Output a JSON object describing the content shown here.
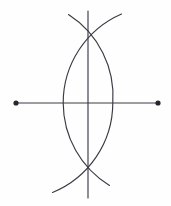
{
  "figure": {
    "title": "Perpendicular bisector construction",
    "kind": "geometric-construction",
    "background_color": "#fefefe",
    "stroke_color": "#3a3a44",
    "dot_color": "#26262e",
    "stroke_width": 1.15,
    "canvas": {
      "width": 171,
      "height": 206
    }
  },
  "geometry": {
    "segment": {
      "name": "base-segment",
      "x1": 16,
      "y1": 103,
      "x2": 158,
      "y2": 103,
      "length_px": 142
    },
    "endpoints": [
      {
        "name": "left-endpoint",
        "cx": 16,
        "cy": 103,
        "r": 2.6
      },
      {
        "name": "right-endpoint",
        "cx": 158,
        "cy": 103,
        "r": 2.6
      }
    ],
    "arcs": [
      {
        "name": "arc-from-left-endpoint",
        "center_x": 16,
        "center_y": 103,
        "radius": 97,
        "path": "M 68.5 14.5 A 97 97 0 0 1 112.8 103 A 97 97 0 0 1 52.5 192.5"
      },
      {
        "name": "arc-from-right-endpoint",
        "center_x": 158,
        "center_y": 103,
        "radius": 97,
        "path": "M 121.5 14.0 A 97 97 0 0 0 63.2 103 A 97 97 0 0 0 109.5 185.5"
      }
    ],
    "bisector": {
      "name": "perpendicular-bisector",
      "x1": 88,
      "y1": 11,
      "x2": 88,
      "y2": 198
    },
    "intersections": [
      {
        "name": "upper-arc-intersection",
        "x": 88,
        "y": 22
      },
      {
        "name": "lower-arc-intersection",
        "x": 88,
        "y": 182
      },
      {
        "name": "midpoint",
        "x": 88,
        "y": 103
      }
    ]
  },
  "labels": {
    "segment_label": "",
    "left_point_label": "",
    "right_point_label": "",
    "bisector_label": ""
  }
}
